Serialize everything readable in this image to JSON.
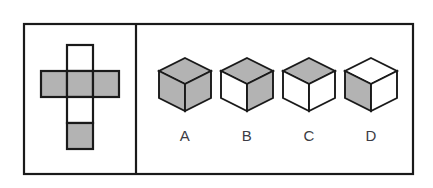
{
  "figure": {
    "background_color": "#ffffff",
    "stroke_color": "#1a1a1a",
    "shaded_color": "#b3b3b3",
    "unshaded_color": "#ffffff",
    "label_color": "#3c3c44"
  },
  "frame": {
    "x": 24,
    "y": 24,
    "width": 389,
    "height": 150,
    "divider_x": 136
  },
  "left_panel": {
    "name": "cube-net-panel",
    "net_shape": "cross",
    "cell_size": 26,
    "origin_x": 41,
    "origin_y": 45,
    "cells": [
      {
        "id": "top",
        "row": 0,
        "col": 1,
        "fill": "unshaded",
        "fill_color": "#ffffff"
      },
      {
        "id": "middle-left",
        "row": 1,
        "col": 0,
        "fill": "shaded",
        "fill_color": "#b3b3b3"
      },
      {
        "id": "middle-center",
        "row": 1,
        "col": 1,
        "fill": "shaded",
        "fill_color": "#b3b3b3"
      },
      {
        "id": "middle-right",
        "row": 1,
        "col": 2,
        "fill": "shaded",
        "fill_color": "#b3b3b3"
      },
      {
        "id": "lower",
        "row": 2,
        "col": 1,
        "fill": "unshaded",
        "fill_color": "#ffffff"
      },
      {
        "id": "bottom",
        "row": 3,
        "col": 1,
        "fill": "shaded",
        "fill_color": "#b3b3b3"
      }
    ]
  },
  "right_panel": {
    "name": "answer-options-panel",
    "options": [
      {
        "label": "A",
        "center_x": 185,
        "top_face": {
          "fill": "shaded",
          "fill_color": "#b3b3b3"
        },
        "left_face": {
          "fill": "shaded",
          "fill_color": "#b3b3b3"
        },
        "right_face": {
          "fill": "shaded",
          "fill_color": "#b3b3b3"
        }
      },
      {
        "label": "B",
        "center_x": 247,
        "top_face": {
          "fill": "shaded",
          "fill_color": "#b3b3b3"
        },
        "left_face": {
          "fill": "unshaded",
          "fill_color": "#ffffff"
        },
        "right_face": {
          "fill": "shaded",
          "fill_color": "#b3b3b3"
        }
      },
      {
        "label": "C",
        "center_x": 309,
        "top_face": {
          "fill": "shaded",
          "fill_color": "#b3b3b3"
        },
        "left_face": {
          "fill": "unshaded",
          "fill_color": "#ffffff"
        },
        "right_face": {
          "fill": "unshaded",
          "fill_color": "#ffffff"
        }
      },
      {
        "label": "D",
        "center_x": 371,
        "top_face": {
          "fill": "unshaded",
          "fill_color": "#ffffff"
        },
        "left_face": {
          "fill": "shaded",
          "fill_color": "#b3b3b3"
        },
        "right_face": {
          "fill": "unshaded",
          "fill_color": "#ffffff"
        }
      }
    ],
    "label_baseline_y": 141
  }
}
